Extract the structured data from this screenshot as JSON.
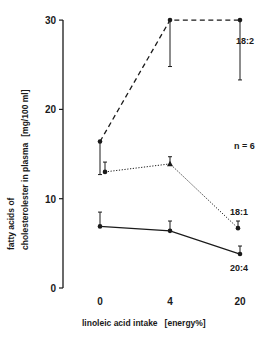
{
  "chart_data": {
    "type": "line",
    "title": "",
    "xlabel": "linoleic acid intake",
    "xlabel_unit": "[energy%]",
    "ylabel_line1": "fatty acids of",
    "ylabel_line2": "cholesterolester in plasma",
    "ylabel_unit": "[mg/100 ml]",
    "x": [
      0,
      4,
      20
    ],
    "x_tick_labels": [
      "0",
      "4",
      "20"
    ],
    "y_ticks": [
      0,
      10,
      20,
      30
    ],
    "y_tick_labels": [
      "0",
      "10",
      "20",
      "30"
    ],
    "ylim": [
      0,
      30
    ],
    "grid": false,
    "annotation": "n = 6",
    "series": [
      {
        "name": "18:2",
        "line_style": "dashed",
        "marker": "circle",
        "values": [
          16.4,
          30.0,
          30.0
        ],
        "error_low": [
          12.7,
          24.8,
          23.3
        ],
        "error_high": [
          16.4,
          30.0,
          30.0
        ]
      },
      {
        "name": "18:1",
        "line_style": "dotted",
        "marker": "circle/triangle",
        "values": [
          13.0,
          13.9,
          6.7
        ],
        "error_low": [
          13.0,
          13.9,
          6.7
        ],
        "error_high": [
          14.1,
          14.7,
          7.5
        ]
      },
      {
        "name": "20:4",
        "line_style": "solid",
        "marker": "circle",
        "values": [
          6.9,
          6.4,
          3.8
        ],
        "error_low": [
          6.9,
          6.4,
          3.8
        ],
        "error_high": [
          8.5,
          7.5,
          4.7
        ]
      }
    ]
  }
}
